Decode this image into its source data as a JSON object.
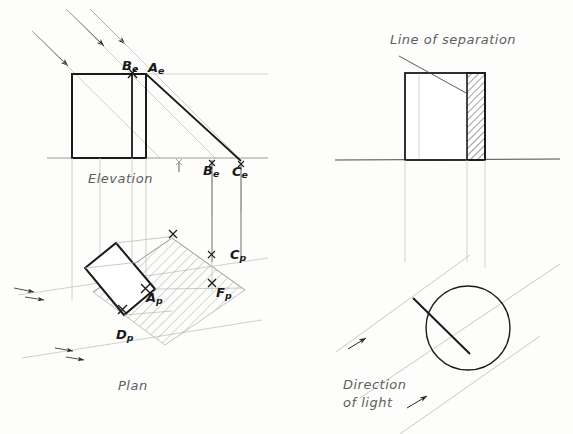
{
  "sheet": {
    "background_color": "#fdfdfc",
    "ink_color": "#1a1a1a",
    "construction_color": "#b9b9b4",
    "label_color": "#5d5d5d"
  },
  "figures": {
    "elevation": {
      "title": "Elevation",
      "points": [
        {
          "id": "Be_top",
          "letter": "B",
          "subscript": "e"
        },
        {
          "id": "Ae_top",
          "letter": "A",
          "subscript": "e"
        },
        {
          "id": "Be_ground",
          "letter": "B",
          "subscript": "e"
        },
        {
          "id": "Ce_ground",
          "letter": "C",
          "subscript": "e"
        }
      ]
    },
    "plan": {
      "title": "Plan",
      "points": [
        {
          "id": "Ap",
          "letter": "A",
          "subscript": "p"
        },
        {
          "id": "Dp",
          "letter": "D",
          "subscript": "p"
        },
        {
          "id": "Cp",
          "letter": "C",
          "subscript": "p"
        },
        {
          "id": "Fp",
          "letter": "F",
          "subscript": "p"
        }
      ]
    },
    "separation": {
      "annotation": "Line of separation"
    },
    "light": {
      "annotation_line1": "Direction",
      "annotation_line2": "of light"
    }
  },
  "labels": {
    "A": "A",
    "B": "B",
    "C": "C",
    "D": "D",
    "F": "F",
    "sub_e": "e",
    "sub_p": "p"
  }
}
